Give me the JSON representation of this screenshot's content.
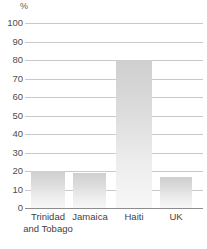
{
  "chart_data": {
    "type": "bar",
    "title": "",
    "subtitle": "",
    "xlabel": "",
    "ylabel": "%",
    "unit_label": "%",
    "categories": [
      "Trinidad and Tobago",
      "Jamaica",
      "Haiti",
      "UK"
    ],
    "category_lines": [
      [
        "Trinidad",
        "and Tobago"
      ],
      [
        "Jamaica"
      ],
      [
        "Haiti"
      ],
      [
        "UK"
      ]
    ],
    "values": [
      20,
      19,
      80,
      17
    ],
    "ylim": [
      0,
      100
    ],
    "ytick_step": 10,
    "yticks": [
      "100",
      "90",
      "80",
      "70",
      "60",
      "50",
      "40",
      "30",
      "20",
      "10",
      "0"
    ],
    "ytick_values": [
      100,
      90,
      80,
      70,
      60,
      50,
      40,
      30,
      20,
      10,
      0
    ],
    "grid": true,
    "grid_axis": "y",
    "legend": "none",
    "legend_position": "none",
    "bar_color_top": "#cfcfcf",
    "bar_color_bottom": "#f7f7f7",
    "gridline_color": "#c9c9c9",
    "baseline_color": "#8d8d8d",
    "background_color": "#ffffff",
    "text_color": "#4a4a4a"
  }
}
